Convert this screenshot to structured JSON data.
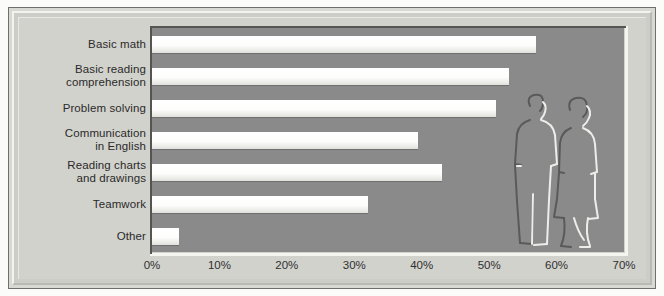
{
  "chart_data": {
    "type": "bar",
    "orientation": "horizontal",
    "title": "",
    "subtitle": "",
    "xlabel": "",
    "ylabel": "",
    "categories": [
      "Basic math",
      "Basic reading\ncomprehension",
      "Problem solving",
      "Communication\nin English",
      "Reading charts\nand drawings",
      "Teamwork",
      "Other"
    ],
    "values": [
      57,
      53,
      51,
      39.5,
      43,
      32,
      4
    ],
    "xlim": [
      0,
      70
    ],
    "xticks": [
      0,
      10,
      20,
      30,
      40,
      50,
      60,
      70
    ],
    "xtick_labels": [
      "0%",
      "10%",
      "20%",
      "30%",
      "40%",
      "50%",
      "60%",
      "70%"
    ],
    "grid": false,
    "legend": "none",
    "series": [
      {
        "name": "Percent of respondents",
        "values": [
          57,
          53,
          51,
          39.5,
          43,
          32,
          4
        ]
      }
    ],
    "annotations": [
      {
        "name": "people-illustration",
        "description": "Embossed outline drawing of two standing people inside the plot area, right side"
      }
    ]
  },
  "colors": {
    "page_background": "#fbfbf9",
    "frame_border": "#6f6f6f",
    "panel_background": "#d2d2cd",
    "plot_background": "#8a8a8a",
    "bar_fill": "#fdfdfb",
    "bar_shadow": "#3c3c3c",
    "text": "#2a2a2a"
  }
}
